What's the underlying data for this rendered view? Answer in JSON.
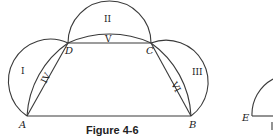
{
  "figure": {
    "caption": "Figure 4-6",
    "points": {
      "A": "A",
      "B": "B",
      "C": "C",
      "D": "D",
      "E": "E"
    },
    "regions": {
      "I": "I",
      "II": "II",
      "III": "III",
      "IV": "IV",
      "V": "V",
      "VI": "VI"
    },
    "stroke_color": "#3a3a3a"
  }
}
